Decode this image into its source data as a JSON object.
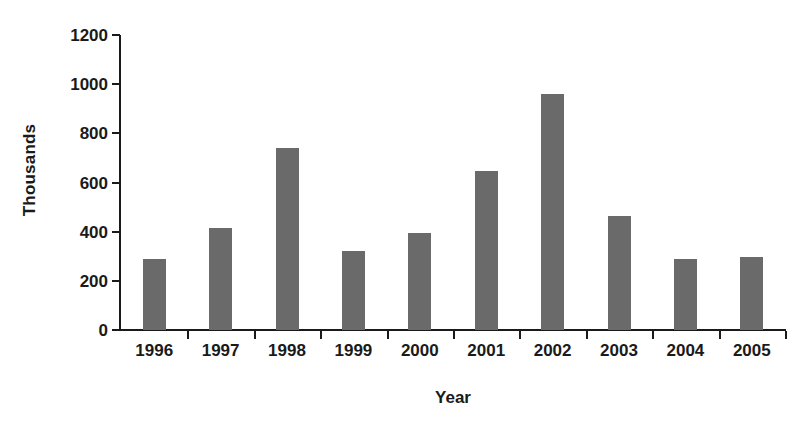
{
  "chart_data": {
    "type": "bar",
    "title": "",
    "xlabel": "Year",
    "ylabel": "Thousands",
    "categories": [
      "1996",
      "1997",
      "1998",
      "1999",
      "2000",
      "2001",
      "2002",
      "2003",
      "2004",
      "2005"
    ],
    "values": [
      290,
      415,
      740,
      320,
      395,
      645,
      962,
      462,
      288,
      295
    ],
    "ylim": [
      0,
      1200
    ],
    "ytick_values": [
      0,
      200,
      400,
      600,
      800,
      1000,
      1200
    ],
    "ytick_labels": [
      "0",
      "200",
      "400",
      "600",
      "800",
      "1000",
      "1200"
    ],
    "grid": false,
    "legend": null,
    "series": [
      {
        "name": "Thousands",
        "values": [
          290,
          415,
          740,
          320,
          395,
          645,
          962,
          462,
          288,
          295
        ]
      }
    ],
    "colors": {
      "bar_fill": "#6a6a6a",
      "axis": "#1a1a1a",
      "text": "#1a1a1a",
      "background": "#ffffff"
    }
  }
}
